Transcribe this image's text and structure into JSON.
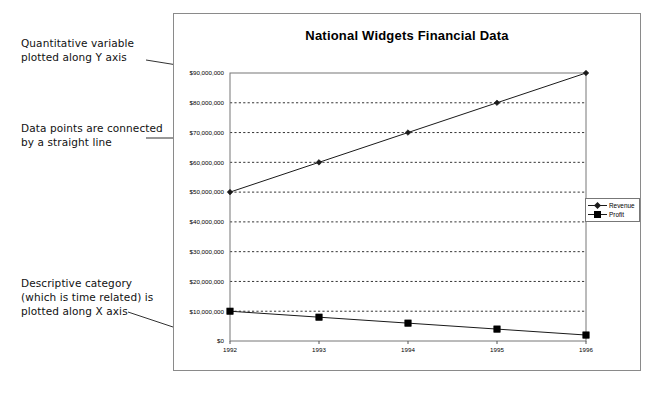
{
  "chart_data": {
    "type": "line",
    "title": "National Widgets Financial Data",
    "xlabel": "",
    "ylabel": "",
    "categories": [
      "1992",
      "1993",
      "1994",
      "1995",
      "1996"
    ],
    "series": [
      {
        "name": "Revenue",
        "marker": "diamond",
        "values": [
          50000000,
          60000000,
          70000000,
          80000000,
          90000000
        ]
      },
      {
        "name": "Profit",
        "marker": "square",
        "values": [
          10000000,
          8000000,
          6000000,
          4000000,
          2000000
        ]
      }
    ],
    "ylim": [
      0,
      90000000
    ],
    "ytick_labels": [
      "$90,000,000",
      "$80,000,000",
      "$70,000,000",
      "$60,000,000",
      "$50,000,000",
      "$40,000,000",
      "$30,000,000",
      "$20,000,000",
      "$10,000,000",
      "$0"
    ],
    "ytick_values": [
      90000000,
      80000000,
      70000000,
      60000000,
      50000000,
      40000000,
      30000000,
      20000000,
      10000000,
      0
    ],
    "grid": true,
    "grid_style": "dotted-horizontal",
    "legend_position": "right",
    "line_color": "#1a1a1a",
    "frame_color": "#8a8a8a"
  },
  "annotations": [
    {
      "text": "Quantitative variable\nplotted along Y axis"
    },
    {
      "text": "Data points are connected\nby a straight line"
    },
    {
      "text": "Descriptive category\n(which is time related) is\nplotted along X axis"
    }
  ]
}
